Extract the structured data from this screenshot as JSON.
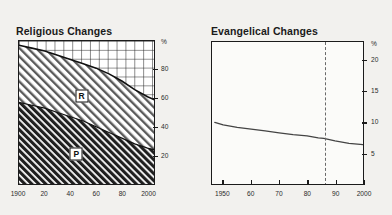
{
  "page": {
    "background": "#f2f1ee",
    "ink": "#1b1b1b"
  },
  "charts": [
    {
      "id": "religious",
      "title": "Religious Changes"
    },
    {
      "id": "evangelical",
      "title": "Evangelical Changes"
    }
  ],
  "chart_data": [
    {
      "type": "area",
      "id": "religious",
      "title": "Religious Changes",
      "xlabel": "",
      "ylabel": "%",
      "xlim": [
        1900,
        2005
      ],
      "ylim": [
        0,
        100
      ],
      "grid": false,
      "legend": "inline-labels",
      "yunit_label": "%",
      "xticks": [
        1900,
        1920,
        1940,
        1960,
        1980,
        2000
      ],
      "xticklabels": [
        "1900",
        "20",
        "40",
        "60",
        "80",
        "2000"
      ],
      "yticks": [
        20,
        40,
        60,
        80
      ],
      "yticklabels": [
        "20",
        "40",
        "60",
        "80"
      ],
      "annotations": [
        {
          "text": "R",
          "x": 1948,
          "y": 62,
          "style": "boxed-letter"
        },
        {
          "text": "P",
          "x": 1944,
          "y": 22,
          "style": "boxed-letter"
        }
      ],
      "series": [
        {
          "name": "P",
          "label": "P",
          "pattern": "dense-diagonal-hatch",
          "fill": "#3a3a3a",
          "x": [
            1900,
            1910,
            1920,
            1930,
            1940,
            1950,
            1960,
            1970,
            1980,
            1990,
            2000,
            2005
          ],
          "values": [
            57,
            55,
            53,
            50,
            47,
            44,
            40,
            36,
            32,
            28,
            25,
            24
          ]
        },
        {
          "name": "R",
          "label": "R",
          "pattern": "light-diagonal-hatch",
          "fill": "#cfcfcf",
          "x": [
            1900,
            1910,
            1920,
            1930,
            1940,
            1950,
            1960,
            1970,
            1980,
            1990,
            2000,
            2005
          ],
          "values": [
            40,
            40,
            40,
            40,
            40,
            40,
            41,
            41,
            40,
            38,
            36,
            35
          ]
        },
        {
          "name": "Other",
          "label": "",
          "pattern": "cross-hatch-grid",
          "fill": "#ffffff",
          "x": [
            1900,
            1910,
            1920,
            1930,
            1940,
            1950,
            1960,
            1970,
            1980,
            1990,
            2000,
            2005
          ],
          "values": [
            3,
            5,
            7,
            10,
            13,
            16,
            19,
            23,
            28,
            34,
            39,
            41
          ]
        }
      ]
    },
    {
      "type": "line",
      "id": "evangelical",
      "title": "Evangelical Changes",
      "xlabel": "",
      "ylabel": "%",
      "xlim": [
        1946,
        2000
      ],
      "ylim": [
        0,
        23
      ],
      "grid": false,
      "yunit_label": "%",
      "xticks": [
        1950,
        1960,
        1970,
        1980,
        1990,
        2000
      ],
      "xticklabels": [
        "1950",
        "60",
        "70",
        "80",
        "90",
        "2000"
      ],
      "yticks": [
        5,
        10,
        15,
        20
      ],
      "yticklabels": [
        "5",
        "10",
        "15",
        "20"
      ],
      "annotations": [
        {
          "type": "vline",
          "x": 1986,
          "style": "dashed",
          "color": "#6a6a6a"
        }
      ],
      "series": [
        {
          "name": "Evangelical share",
          "color": "#444444",
          "x": [
            1947,
            1950,
            1955,
            1960,
            1965,
            1970,
            1975,
            1980,
            1984,
            1986,
            1990,
            1995,
            2000
          ],
          "values": [
            10.0,
            9.6,
            9.2,
            8.9,
            8.6,
            8.3,
            8.0,
            7.8,
            7.5,
            7.4,
            7.0,
            6.6,
            6.4
          ]
        }
      ]
    }
  ]
}
